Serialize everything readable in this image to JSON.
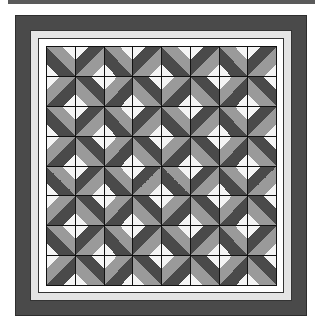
{
  "image": {
    "subject": "quilt-pattern",
    "grid": {
      "rows": 8,
      "cols": 8
    },
    "block_layout": [
      [
        "a",
        "b"
      ],
      [
        "c",
        "d"
      ]
    ],
    "colors": {
      "frame_dark": "#4a4a4a",
      "inner_border_light": "#e4e4e4",
      "inner_border_white": "#ffffff",
      "patch_white": "#f4f4f4",
      "patch_light": "#9a9a9a",
      "patch_dark": "#4a4a4a",
      "seam": "#111111"
    }
  }
}
